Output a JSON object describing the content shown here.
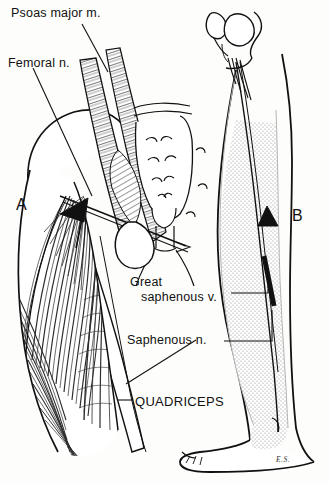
{
  "figure": {
    "background_color": "#fdfdfb",
    "ink_color": "#111111",
    "stipple_color": "#9a9a9a"
  },
  "labels": {
    "psoas_major": "Psoas major m.",
    "femoral_nerve": "Femoral n.",
    "great_saphenous_vein_line1": "Great",
    "great_saphenous_vein_line2": "saphenous v.",
    "saphenous_nerve": "Saphenous n.",
    "quadriceps": "QUADRICEPS"
  },
  "panels": {
    "left_letter": "A",
    "right_letter": "B"
  },
  "signature": "E.S."
}
